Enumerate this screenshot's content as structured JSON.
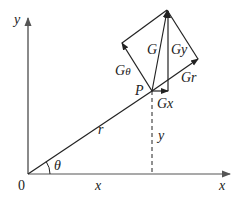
{
  "diagram": {
    "type": "vector-decomposition",
    "axes": {
      "x_label": "x",
      "y_label": "y",
      "origin_label": "0"
    },
    "point": {
      "label": "P"
    },
    "segments": {
      "radius_label": "r",
      "x_label": "x",
      "y_label": "y",
      "angle_label": "θ"
    },
    "vectors": {
      "G": "G",
      "Gx": "Gx",
      "Gy": "Gy",
      "Gr": "Gr",
      "Gtheta_main": "G",
      "Gtheta_sub": "θ"
    },
    "colors": {
      "axis": "#8a8a8a",
      "line": "#222222"
    }
  }
}
